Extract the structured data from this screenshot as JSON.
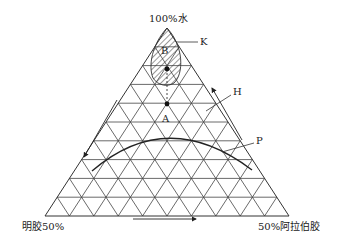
{
  "diagram": {
    "type": "ternary-phase-diagram",
    "vertices": {
      "top": "100%水",
      "bottom_left": "明胶50%",
      "bottom_right": "50%阿拉伯胶"
    },
    "grid_divisions": 10,
    "labels": {
      "K": "K",
      "B": "B",
      "A": "A",
      "H": "H",
      "P": "P"
    },
    "regions": [
      {
        "id": "K",
        "description": "hatched region near water apex",
        "label_point": "B"
      }
    ],
    "points": [
      {
        "id": "B-point",
        "description": "dot inside hatched region"
      },
      {
        "id": "A",
        "description": "dot on dashed line below hatched region"
      }
    ],
    "curves": [
      {
        "id": "P",
        "description": "phase boundary arc"
      }
    ],
    "arrows": [
      {
        "side": "left",
        "direction": "down"
      },
      {
        "side": "bottom",
        "direction": "right"
      },
      {
        "side": "right",
        "direction": "up"
      }
    ],
    "colors": {
      "line": "#333333",
      "background": "#ffffff"
    }
  }
}
